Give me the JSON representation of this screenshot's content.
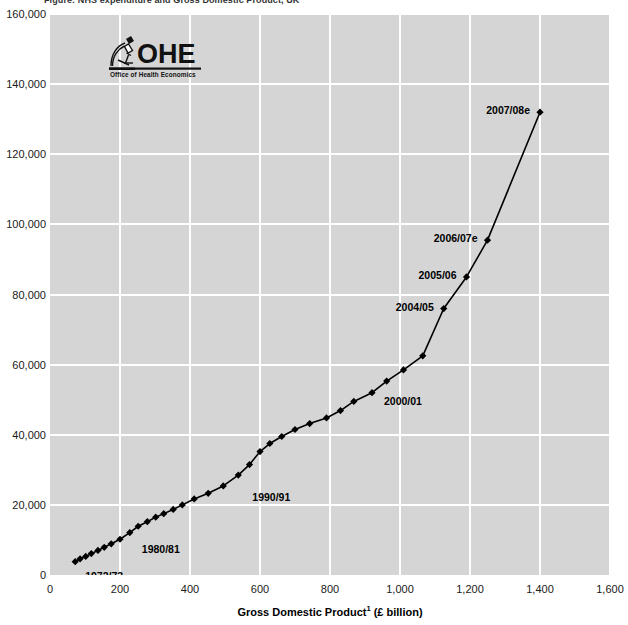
{
  "title_partial": "Figure: NHS expenditure and Gross Domestic Product, UK",
  "logo": {
    "name": "OHE",
    "wordmark": "OHE",
    "strapline": "Office of Health Economics",
    "icon": "microscope-icon"
  },
  "axes": {
    "x": {
      "label_main": "Gross Domestic Product",
      "label_superscript": "1",
      "label_unit": "(£ billion)",
      "ticks": [
        "0",
        "200",
        "400",
        "600",
        "800",
        "1,000",
        "1,200",
        "1,400",
        "1,600"
      ],
      "min": 0,
      "max": 1600,
      "step": 200
    },
    "y": {
      "label": "",
      "ticks": [
        "0",
        "20,000",
        "40,000",
        "60,000",
        "80,000",
        "100,000",
        "120,000",
        "140,000",
        "160,000"
      ],
      "min": 0,
      "max": 160000,
      "step": 20000
    }
  },
  "colors": {
    "plot_background": "#d5d5d5",
    "gridline": "#ffffff",
    "series_line": "#000000",
    "marker": "#000000",
    "text": "#1a1a1a",
    "page_background": "#ffffff"
  },
  "annotations": [
    {
      "text": "1972/73",
      "point_index": 0,
      "dx": 10,
      "dy": 14,
      "anchor": "start"
    },
    {
      "text": "1980/81",
      "point_index": 8,
      "dx": 12,
      "dy": 16,
      "anchor": "start"
    },
    {
      "text": "1990/91",
      "point_index": 18,
      "dx": 14,
      "dy": 22,
      "anchor": "start"
    },
    {
      "text": "2000/01",
      "point_index": 28,
      "dx": 12,
      "dy": 8,
      "anchor": "start"
    },
    {
      "text": "2004/05",
      "point_index": 32,
      "dx": -10,
      "dy": -2,
      "anchor": "end"
    },
    {
      "text": "2005/06",
      "point_index": 33,
      "dx": -10,
      "dy": -2,
      "anchor": "end"
    },
    {
      "text": "2006/07e",
      "point_index": 34,
      "dx": -10,
      "dy": -2,
      "anchor": "end"
    },
    {
      "text": "2007/08e",
      "point_index": 35,
      "dx": -10,
      "dy": -2,
      "anchor": "end"
    }
  ],
  "chart_data": {
    "type": "line",
    "title": "NHS expenditure and Gross Domestic Product, UK",
    "xlabel": "Gross Domestic Product¹ (£ billion)",
    "ylabel": "NHS expenditure (£ million)",
    "xlim": [
      0,
      1600
    ],
    "ylim": [
      0,
      160000
    ],
    "xticks": [
      0,
      200,
      400,
      600,
      800,
      1000,
      1200,
      1400,
      1600
    ],
    "yticks": [
      0,
      20000,
      40000,
      60000,
      80000,
      100000,
      120000,
      140000,
      160000
    ],
    "grid": true,
    "legend": "none",
    "markers": "filled-diamond",
    "series": [
      {
        "name": "NHS expenditure vs GDP",
        "point_labels": [
          "1972/73",
          "1973/74",
          "1974/75",
          "1975/76",
          "1976/77",
          "1977/78",
          "1978/79",
          "1979/80",
          "1980/81",
          "1981/82",
          "1982/83",
          "1983/84",
          "1984/85",
          "1985/86",
          "1986/87",
          "1987/88",
          "1988/89",
          "1989/90",
          "1990/91",
          "1991/92",
          "1992/93",
          "1993/94",
          "1994/95",
          "1995/96",
          "1996/97",
          "1997/98",
          "1998/99",
          "1999/00",
          "2000/01",
          "2001/02",
          "2002/03",
          "2003/04",
          "2004/05",
          "2005/06",
          "2006/07e",
          "2007/08e"
        ],
        "x": [
          72,
          86,
          102,
          118,
          137,
          155,
          175,
          200,
          228,
          252,
          278,
          302,
          325,
          352,
          378,
          412,
          452,
          495,
          538,
          570,
          600,
          628,
          662,
          700,
          742,
          790,
          830,
          868,
          920,
          962,
          1010,
          1065,
          1125,
          1190,
          1250,
          1400
        ],
        "y": [
          3800,
          4600,
          5300,
          6100,
          7000,
          7900,
          8900,
          10200,
          12100,
          13900,
          15200,
          16500,
          17500,
          18700,
          20000,
          21700,
          23300,
          25400,
          28500,
          31500,
          35200,
          37500,
          39500,
          41500,
          43200,
          44800,
          46900,
          49500,
          52000,
          55300,
          58500,
          62500,
          76000,
          85000,
          95500,
          132000
        ]
      }
    ]
  },
  "series_points": [
    {
      "x": 72,
      "y": 3800
    },
    {
      "x": 86,
      "y": 4600
    },
    {
      "x": 102,
      "y": 5300
    },
    {
      "x": 118,
      "y": 6100
    },
    {
      "x": 137,
      "y": 7000
    },
    {
      "x": 155,
      "y": 7900
    },
    {
      "x": 175,
      "y": 8900
    },
    {
      "x": 200,
      "y": 10200
    },
    {
      "x": 228,
      "y": 12100
    },
    {
      "x": 252,
      "y": 13900
    },
    {
      "x": 278,
      "y": 15200
    },
    {
      "x": 302,
      "y": 16500
    },
    {
      "x": 325,
      "y": 17500
    },
    {
      "x": 352,
      "y": 18700
    },
    {
      "x": 378,
      "y": 20000
    },
    {
      "x": 412,
      "y": 21700
    },
    {
      "x": 452,
      "y": 23300
    },
    {
      "x": 495,
      "y": 25400
    },
    {
      "x": 538,
      "y": 28500
    },
    {
      "x": 570,
      "y": 31500
    },
    {
      "x": 600,
      "y": 35200
    },
    {
      "x": 628,
      "y": 37500
    },
    {
      "x": 662,
      "y": 39500
    },
    {
      "x": 700,
      "y": 41500
    },
    {
      "x": 742,
      "y": 43200
    },
    {
      "x": 790,
      "y": 44800
    },
    {
      "x": 830,
      "y": 46900
    },
    {
      "x": 868,
      "y": 49500
    },
    {
      "x": 920,
      "y": 52000
    },
    {
      "x": 962,
      "y": 55300
    },
    {
      "x": 1010,
      "y": 58500
    },
    {
      "x": 1065,
      "y": 62500
    },
    {
      "x": 1125,
      "y": 76000
    },
    {
      "x": 1190,
      "y": 85000
    },
    {
      "x": 1250,
      "y": 95500
    },
    {
      "x": 1400,
      "y": 132000
    }
  ]
}
